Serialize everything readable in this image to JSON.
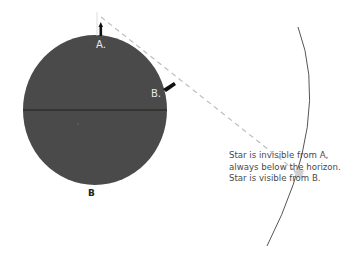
{
  "figure": {
    "panel_label": "B",
    "observers": [
      {
        "id": "A",
        "label": "A."
      },
      {
        "id": "B",
        "label": "B."
      }
    ],
    "caption_lines": [
      "Star is invisible from A,",
      "always below the horizon.",
      "Star is visible from B."
    ],
    "colors": {
      "planet": "#4a4a4a",
      "equator": "#1e1e1e",
      "sight_line": "#b8b8b8",
      "sky_arc": "#555555",
      "star": "#d8d8d8",
      "observer_marker": "#111111"
    }
  }
}
